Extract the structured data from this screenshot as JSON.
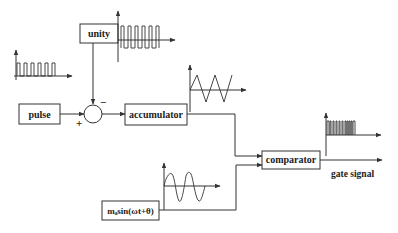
{
  "diagram": {
    "type": "block-diagram",
    "blocks": {
      "unity": {
        "label": "unity"
      },
      "pulse": {
        "label": "pulse"
      },
      "accumulator": {
        "label": "accumulator"
      },
      "comparator": {
        "label": "comparator"
      },
      "sine_source": {
        "label": "mₐsin(ωt+θ)"
      }
    },
    "summing_junction": {
      "plus_sign": "+",
      "minus_sign": "−"
    },
    "output_label": "gate signal",
    "waveforms": {
      "pulse_train": "pulse-train",
      "square_wave": "square-wave",
      "triangle_wave": "triangle-wave",
      "sine_wave": "sine-wave",
      "gate_pulses": "pwm-pulses"
    },
    "connections": [
      {
        "from": "pulse",
        "to": "summing_junction",
        "sign": "+"
      },
      {
        "from": "unity",
        "to": "summing_junction",
        "sign": "-"
      },
      {
        "from": "summing_junction",
        "to": "accumulator"
      },
      {
        "from": "accumulator",
        "to": "comparator"
      },
      {
        "from": "sine_source",
        "to": "comparator"
      },
      {
        "from": "comparator",
        "to": "gate signal"
      }
    ]
  }
}
